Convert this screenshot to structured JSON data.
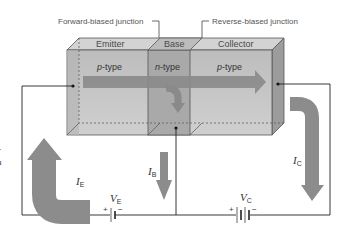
{
  "diagram": {
    "junction_labels": {
      "forward": "Forward-biased junction",
      "reverse": "Reverse-biased junction"
    },
    "regions": [
      {
        "name": "Emitter",
        "type_prefix": "p",
        "type_suffix": "-type"
      },
      {
        "name": "Base",
        "type_prefix": "n",
        "type_suffix": "-type"
      },
      {
        "name": "Collector",
        "type_prefix": "p",
        "type_suffix": "-type"
      }
    ],
    "currents": {
      "emitter": {
        "symbol": "I",
        "sub": "E"
      },
      "base": {
        "symbol": "I",
        "sub": "B"
      },
      "collector": {
        "symbol": "I",
        "sub": "C"
      }
    },
    "sources": {
      "emitter": {
        "symbol": "V",
        "sub": "E",
        "plus": "+",
        "minus": "−"
      },
      "collector": {
        "symbol": "V",
        "sub": "C",
        "plus": "+",
        "minus": "−"
      }
    },
    "clipped_text": {
      "line1": "-",
      "line2": "n"
    },
    "colors": {
      "block_front": "#c4c4c4",
      "block_top": "#d6d6d6",
      "block_side": "#9a9a9a",
      "base_region": "#a8a8a8",
      "arrow": "#8c8c8c",
      "wire": "#222222"
    }
  }
}
